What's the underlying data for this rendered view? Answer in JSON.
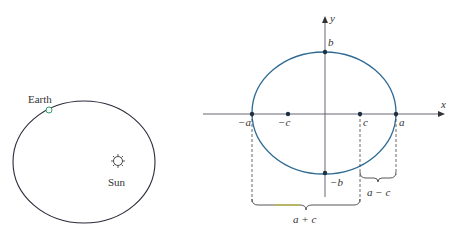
{
  "left_figure": {
    "earth_label": "Earth",
    "sun_label": "Sun",
    "orbit_color": "#2a2a3a",
    "earth_color": "#2aa06a"
  },
  "right_figure": {
    "axis_labels": {
      "x": "x",
      "y": "y"
    },
    "points": {
      "neg_a": "−a",
      "neg_c": "−c",
      "c": "c",
      "a": "a",
      "b": "b",
      "neg_b": "−b"
    },
    "braces": {
      "a_plus_c": "a + c",
      "a_minus_c": "a − c"
    },
    "ellipse_color": "#2e6a93",
    "axis_color": "#555566"
  }
}
